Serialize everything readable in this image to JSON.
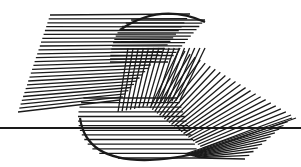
{
  "canvas": {
    "width": 301,
    "height": 167,
    "background": "#ffffff"
  },
  "artwork": {
    "name": "string-art-logo",
    "ink_color": "#1a1a1a",
    "rule": {
      "x1": 0,
      "y1": 128,
      "x2": 301,
      "y2": 128,
      "width": 2
    },
    "upper_left_fan": {
      "count": 26,
      "outer_start": [
        50,
        15
      ],
      "outer_end": [
        18,
        112
      ],
      "inner_curve": {
        "cx": 145,
        "cy": 62,
        "rx": 40,
        "ry": 48,
        "a0": 200,
        "a1": 125
      }
    },
    "upper_hatch": {
      "count": 14,
      "y_start": 20,
      "y_end": 62,
      "left_curve": {
        "cx": 150,
        "cy": 62,
        "rx": 30,
        "ry": 44
      },
      "right_x_start": 205,
      "right_x_end": 168
    },
    "cap_arc": {
      "d": "M120 30 Q160 2 205 22"
    },
    "center_cross": {
      "count": 16,
      "x_start": 128,
      "x_end": 205,
      "top_y": 48,
      "bottom_curve": {
        "cx": 150,
        "cy": 112,
        "rx": 30,
        "ry": 30
      }
    },
    "right_fan": {
      "count": 24,
      "hub_curve": {
        "cx": 190,
        "cy": 130,
        "rx": 26,
        "ry": 32,
        "a0": 270,
        "a1": 200
      },
      "outer_start": [
        180,
        48
      ],
      "outer_end": [
        296,
        118
      ]
    },
    "lower_hatch": {
      "count": 14,
      "y_start": 98,
      "y_end": 158,
      "left_curve": {
        "cx": 118,
        "cy": 118,
        "rx": 40,
        "ry": 40
      },
      "right_x_start": 178,
      "right_x_end": 200
    },
    "lower_right_fan": {
      "count": 12,
      "hub": [
        200,
        158
      ],
      "ends_start": [
        292,
        118
      ],
      "ends_end": [
        245,
        159
      ]
    },
    "lower_arc": {
      "d": "M80 118 Q86 162 150 160 Q185 158 205 150"
    }
  }
}
